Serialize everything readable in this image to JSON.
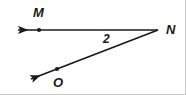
{
  "figure": {
    "kind": "geometry-diagram",
    "width": 186,
    "height": 95,
    "background_color": "#ffffff",
    "stroke_color": "#1a1a1a",
    "border_color": "#c9c9c9"
  },
  "vertex": {
    "name": "N",
    "label": "N",
    "x": 158,
    "y": 30,
    "label_x": 166,
    "label_y": 23
  },
  "angle": {
    "label": "2",
    "label_x": 103,
    "label_y": 33
  },
  "rays": [
    {
      "name": "ray-NM",
      "label_point": "M",
      "from_x": 158,
      "from_y": 30,
      "to_x": 10,
      "to_y": 30,
      "arrow_at": "to",
      "point_x": 39,
      "point_y": 30,
      "point_label_x": 33,
      "point_label_y": 7
    },
    {
      "name": "ray-NO",
      "label_point": "O",
      "from_x": 158,
      "from_y": 30,
      "to_x": 23,
      "to_y": 82,
      "arrow_at": "to",
      "point_x": 57,
      "point_y": 69,
      "point_label_x": 53,
      "point_label_y": 76
    }
  ],
  "labels": {
    "m": "M",
    "n": "N",
    "o": "O",
    "angle_two": "2"
  }
}
